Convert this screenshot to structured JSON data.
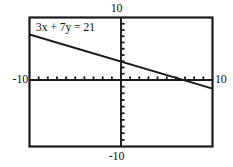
{
  "figure": {
    "name": "coordinate-plane-graph",
    "annotation": "3x + 7y = 21"
  },
  "labels": {
    "top": "10",
    "bottom": "-10",
    "left": "-10",
    "right": "10"
  },
  "colors": {
    "frame": "#1a1a1a",
    "axis": "#1a1a1a",
    "line": "#1a1a1a",
    "background": "#ffffff"
  },
  "chart_data": {
    "type": "line",
    "title": "",
    "subtitle": "",
    "xlabel": "",
    "ylabel": "",
    "xlim": [
      -10,
      10
    ],
    "ylim": [
      -10,
      10
    ],
    "grid": false,
    "legend": "none",
    "x_tick_interval": 1,
    "y_tick_interval": 1,
    "x_tick_labels": [
      "-10",
      "10"
    ],
    "y_tick_labels": [
      "-10",
      "10"
    ],
    "annotations": [
      {
        "text": "3x + 7y = 21",
        "x": -8.5,
        "y": 8.4
      }
    ],
    "series": [
      {
        "name": "3x + 7y = 21",
        "equation": "3x + 7y = 21",
        "slope": -0.4285714285714286,
        "intercept": 3,
        "x_intercept": 7,
        "y_intercept": 3,
        "x": [
          -10,
          10
        ],
        "values": [
          7.285714285714286,
          -1.2857142857142858
        ]
      }
    ]
  }
}
